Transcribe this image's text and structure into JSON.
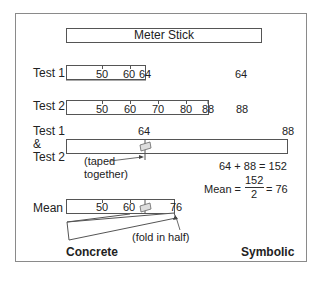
{
  "meter_stick": {
    "label": "Meter Stick"
  },
  "test1": {
    "label": "Test 1",
    "ticks": [
      "50",
      "60",
      "64"
    ],
    "value": "64"
  },
  "test2": {
    "label": "Test 2",
    "ticks": [
      "50",
      "60",
      "70",
      "80",
      "88"
    ],
    "value": "88"
  },
  "combined": {
    "label_line1": "Test 1",
    "label_line2": "&",
    "label_line3": "Test 2",
    "mark_left": "64",
    "mark_right": "88",
    "annotation_line1": "(taped",
    "annotation_line2": "together)"
  },
  "symbolic": {
    "sum": "64 + 88 = 152",
    "mean_prefix": "Mean =",
    "numerator": "152",
    "denominator": "2",
    "mean_result": "= 76"
  },
  "mean": {
    "label": "Mean",
    "ticks": [
      "50",
      "60",
      "76"
    ],
    "annotation": "(fold in half)"
  },
  "footer": {
    "left": "Concrete",
    "right": "Symbolic"
  }
}
